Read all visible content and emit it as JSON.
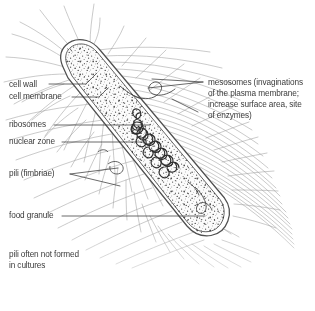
{
  "figure": {
    "style": "pencil line drawing, stippled cytoplasm",
    "background_color": "#ffffff",
    "ink_color": "#555555",
    "text_color": "#3b3b3b"
  },
  "labels": {
    "cell_wall": "cell wall",
    "cell_membrane": "cell membrane",
    "ribosomes": "ribosomes",
    "nuclear_zone": "nuclear zone",
    "pili": "pili (fimbriae)",
    "food_granule": "food granule",
    "note_line1": "pili often not formed",
    "note_line2": "in cultures",
    "mesosomes_line1": "mesosomes (invaginations",
    "mesosomes_line2": "of the plasma membrane;",
    "mesosomes_line3": "increase surface area, site",
    "mesosomes_line4": "of enzymes)"
  }
}
